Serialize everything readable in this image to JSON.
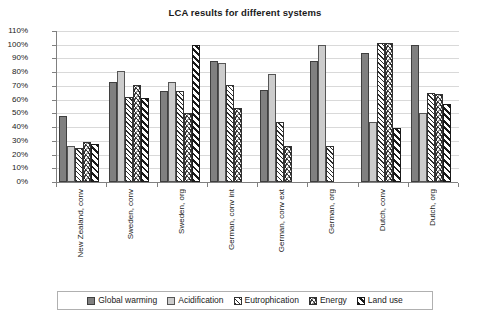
{
  "chart_data": {
    "type": "bar",
    "title": "LCA results for different systems",
    "xlabel": "",
    "ylabel": "",
    "ylim": [
      0,
      110
    ],
    "ytick_labels": [
      "0%",
      "10%",
      "20%",
      "30%",
      "40%",
      "50%",
      "60%",
      "70%",
      "80%",
      "90%",
      "100%",
      "110%"
    ],
    "ytick_values": [
      0,
      10,
      20,
      30,
      40,
      50,
      60,
      70,
      80,
      90,
      100,
      110
    ],
    "grid": true,
    "legend_position": "bottom",
    "categories": [
      "New Zealand, conv",
      "Sweden, conv",
      "Sweden, org",
      "German, conv int",
      "German, conv ext",
      "German, org",
      "Dutch, conv",
      "Dutch, org"
    ],
    "series": [
      {
        "name": "Global warming",
        "color": "#808080",
        "pattern": "solid-dark-gray",
        "values": [
          48,
          73,
          66,
          88,
          67,
          88,
          94,
          100
        ]
      },
      {
        "name": "Acidification",
        "color": "#cccccc",
        "pattern": "solid-light-gray",
        "values": [
          26,
          81,
          73,
          87,
          79,
          100,
          44,
          50
        ]
      },
      {
        "name": "Eutrophication",
        "color": "#ffffff",
        "pattern": "diagonal-hatch-light",
        "values": [
          25,
          62,
          66,
          71,
          44,
          26,
          101,
          65
        ]
      },
      {
        "name": "Energy",
        "color": "#ffffff",
        "pattern": "chevron-herringbone",
        "values": [
          29,
          71,
          50,
          54,
          26,
          null,
          101,
          64
        ]
      },
      {
        "name": "Land use",
        "color": "#ffffff",
        "pattern": "diagonal-stripe-dark",
        "values": [
          28,
          61,
          100,
          null,
          null,
          null,
          39,
          57
        ]
      }
    ]
  }
}
